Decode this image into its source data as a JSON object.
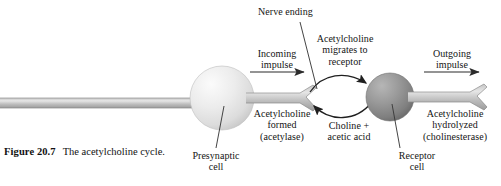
{
  "figure": {
    "caption_head": "Figure 20.7",
    "caption_body": "The acetylcholine cycle.",
    "caption_line1": "The acetylcholine",
    "caption_line2": "cycle."
  },
  "labels": {
    "nerve_ending": "Nerve ending",
    "incoming_impulse": "Incoming\nimpulse",
    "migrates": "Acetylcholine\nmigrates to\nreceptor",
    "outgoing_impulse": "Outgoing\nimpulse",
    "formed": "Acetylcholine\nformed\n(acetylase)",
    "choline": "Choline +\nacetic acid",
    "hydrolyzed": "Acetylcholine\nhydrolyzed\n(cholinesterase)",
    "presynaptic_cell": "Presynaptic\ncell",
    "receptor_cell": "Receptor\ncell"
  },
  "icons": {
    "presynaptic_sphere": "sphere-icon",
    "receptor_sphere": "sphere-icon",
    "incoming_arrow": "arrow-right-icon",
    "outgoing_arrow": "arrow-right-icon",
    "migrate_arrow": "curved-arrow-right-icon",
    "return_arrow": "curved-arrow-left-icon",
    "axon_left": "axon-icon",
    "axon_right": "axon-icon"
  },
  "colors": {
    "background": "#ffffff",
    "text": "#141414",
    "presynaptic_sphere_light": "#f2f2f2",
    "presynaptic_sphere_dark": "#c9c9c9",
    "receptor_sphere_light": "#a8a8a8",
    "receptor_sphere_dark": "#6d6d6d",
    "axon_light": "#d8d8d8",
    "axon_dark": "#9a9a9a",
    "line": "#3a3a3a"
  }
}
